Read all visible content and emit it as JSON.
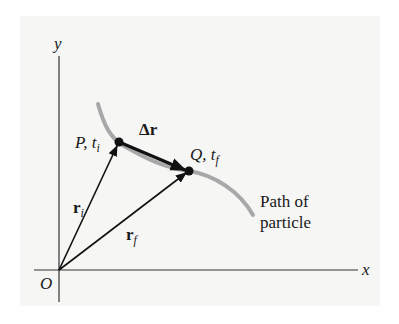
{
  "diagram": {
    "type": "position-vectors-displacement",
    "axes": {
      "x_label": "x",
      "y_label": "y",
      "origin_label": "O"
    },
    "points": [
      {
        "id": "P",
        "label": "P, t",
        "sub": "i"
      },
      {
        "id": "Q",
        "label": "Q, t",
        "sub": "f"
      }
    ],
    "vectors": [
      {
        "id": "ri",
        "label": "r",
        "sub": "i",
        "from": "O",
        "to": "P"
      },
      {
        "id": "rf",
        "label": "r",
        "sub": "f",
        "from": "O",
        "to": "Q"
      },
      {
        "id": "dr",
        "label": "Δr",
        "from": "P",
        "to": "Q"
      }
    ],
    "path_label_line1": "Path of",
    "path_label_line2": "particle",
    "colors": {
      "path": "#a8a8a8",
      "ink": "#111111",
      "background": "#f6f6f5"
    }
  }
}
